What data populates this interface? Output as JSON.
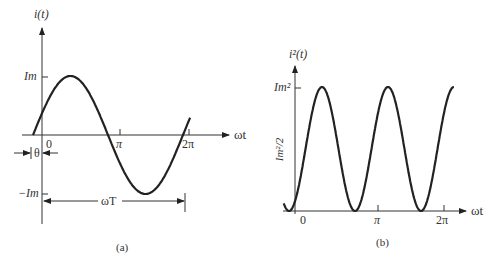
{
  "chart_data": [
    {
      "type": "line",
      "panel_label": "(a)",
      "title": "i(t)",
      "ylabel": "i(t)",
      "xlabel": "ωt",
      "function": "i(t) = Im·sin(ωt + θ)",
      "x_ticks": [
        "0",
        "π",
        "2π"
      ],
      "y_ticks": [
        "Im",
        "-Im"
      ],
      "annotations": [
        "θ",
        "ωT"
      ],
      "phase_offset_theta": "θ (≈0.28 rad)",
      "amplitude": "Im",
      "period": "ωT = 2π",
      "points": {
        "x": [
          "-θ",
          "π/2-θ",
          "π-θ",
          "3π/2-θ",
          "2π-θ"
        ],
        "y": [
          0,
          1,
          0,
          -1,
          0
        ]
      },
      "render": {
        "x0": 33,
        "y0": 135,
        "px_per_period": 150,
        "amp_px": 59,
        "phase_start": 0,
        "phase_end": 6.58
      }
    },
    {
      "type": "line",
      "panel_label": "(b)",
      "title": "i²(t)",
      "ylabel": "i²(t)",
      "xlabel": "ωt",
      "function": "i²(t) = Im²·sin²(ωt + θ)",
      "x_ticks": [
        "0",
        "π",
        "2π"
      ],
      "y_ticks": [
        "Im²",
        "Im²/2"
      ],
      "amplitude": "Im²",
      "points": {
        "x": [
          "-θ",
          "π/4-θ",
          "π/2-θ",
          "3π/4-θ",
          "π-θ"
        ],
        "y": [
          0,
          1,
          0,
          1,
          0
        ]
      },
      "render": {
        "x0": 289,
        "y0": 211,
        "px_per_pi": 66,
        "amp_px": 124,
        "phase_start": -0.25,
        "phase_end": 7.85
      }
    }
  ],
  "panel_a": {
    "ylabel": "i(t)",
    "xlabel": "ωt",
    "tick_zero": "0",
    "tick_pi": "π",
    "tick_2pi": "2π",
    "tick_im": "Im",
    "tick_neg_im": "−Im",
    "theta": "θ",
    "omega_t_span": "ωT",
    "caption": "(a)"
  },
  "panel_b": {
    "ylabel": "i²(t)",
    "xlabel": "ωt",
    "tick_zero": "0",
    "tick_pi": "π",
    "tick_2pi": "2π",
    "tick_im2": "Im²",
    "tick_half": "Im²/2",
    "caption": "(b)"
  }
}
